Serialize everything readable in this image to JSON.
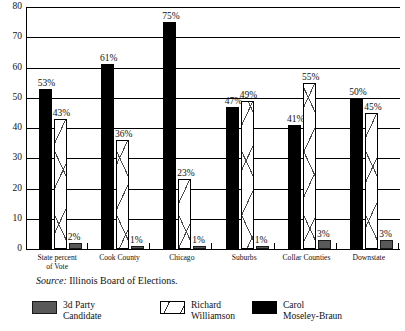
{
  "chart_data": {
    "type": "bar",
    "title": "",
    "subtitle": "",
    "xlabel": "",
    "ylabel": "",
    "ylim": [
      0,
      80
    ],
    "yticks": [
      0,
      10,
      20,
      30,
      40,
      50,
      60,
      70,
      80
    ],
    "ytick_labels": [
      "0",
      "10",
      "20",
      "30",
      "40",
      "50",
      "60",
      "70",
      "80"
    ],
    "grid": "horizontal",
    "legend_position": "bottom",
    "categories": [
      "State percent of Vote",
      "Cook County",
      "Chicago",
      "Suburbs",
      "Collar Counties",
      "Downstate"
    ],
    "category_label_lines": [
      [
        "State percent",
        "of Vote"
      ],
      [
        "Cook County"
      ],
      [
        "Chicago"
      ],
      [
        "Suburbs"
      ],
      [
        "Collar Counties"
      ],
      [
        "Downstate"
      ]
    ],
    "series": [
      {
        "name": "Carol Moseley-Braun",
        "name_lines": [
          "Carol",
          "Moseley-Braun"
        ],
        "fill": "solid-black",
        "color": "#000000",
        "values": [
          53,
          61,
          75,
          47,
          41,
          50
        ],
        "labels": [
          "53%",
          "61%",
          "75%",
          "47%",
          "41%",
          "50%"
        ]
      },
      {
        "name": "Richard Williamson",
        "name_lines": [
          "Richard",
          "Williamson"
        ],
        "fill": "white-hatched",
        "color": "#ffffff",
        "values": [
          43,
          36,
          23,
          49,
          55,
          45
        ],
        "labels": [
          "43%",
          "36%",
          "23%",
          "49%",
          "55%",
          "45%"
        ]
      },
      {
        "name": "3d Party Candidate",
        "name_lines": [
          "3d Party",
          "Candidate"
        ],
        "fill": "solid-gray",
        "color": "#595959",
        "values": [
          2,
          1,
          1,
          1,
          3,
          3
        ],
        "labels": [
          "2%",
          "1%",
          "1%",
          "1%",
          "3%",
          "3%"
        ]
      }
    ],
    "annotations": {
      "source_prefix": "Source:",
      "source_text": "Illinois Board of Elections."
    }
  },
  "legend": {
    "items": [
      {
        "key": "third",
        "line1": "3d Party",
        "line2": "Candidate"
      },
      {
        "key": "richard",
        "line1": "Richard",
        "line2": "Williamson"
      },
      {
        "key": "carol",
        "line1": "Carol",
        "line2": "Moseley-Braun"
      }
    ]
  }
}
